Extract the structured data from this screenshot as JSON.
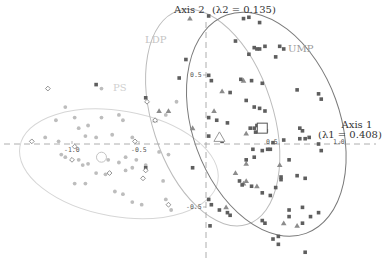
{
  "chart_data": {
    "type": "scatter",
    "title": "",
    "xlabel": "Axis 1",
    "xlabel_sub": "(λ1 = 0.408)",
    "ylabel": "Axis 2",
    "ylabel_sub": "(λ2 = 0.135)",
    "xticks": [
      "-1.0",
      "-0.5",
      "0.5",
      "1.0"
    ],
    "yticks": [
      "0.5",
      "-0.5"
    ],
    "xlim": [
      -1.45,
      1.3
    ],
    "ylim": [
      -0.95,
      1.05
    ],
    "grid": false,
    "groups": [
      {
        "name": "PS",
        "marker": "circle",
        "color": "#bdbdbd",
        "ellipse_color": "#d6d6d6",
        "centroid": [
          -0.78,
          -0.1
        ]
      },
      {
        "name": "LDP",
        "marker": "triangle",
        "color": "#8c8c8c",
        "ellipse_color": "#bcbcbc",
        "centroid": [
          0.1,
          0.05
        ]
      },
      {
        "name": "UMP",
        "marker": "square",
        "color": "#5e5e5e",
        "ellipse_color": "#7a7a7a",
        "centroid": [
          0.42,
          0.12
        ]
      }
    ],
    "other_marker": {
      "name": "other",
      "marker": "open-diamond",
      "color": "#777777"
    },
    "series": [
      {
        "name": "PS",
        "points": [
          [
            -1.05,
            0.28
          ],
          [
            -1.12,
            0.18
          ],
          [
            -0.98,
            0.2
          ],
          [
            -0.95,
            0.12
          ],
          [
            -0.88,
            0.14
          ],
          [
            -0.78,
            0.2
          ],
          [
            -0.65,
            0.22
          ],
          [
            -0.62,
            0.18
          ],
          [
            -0.55,
            0.05
          ],
          [
            -1.2,
            0.05
          ],
          [
            -1.1,
            0.02
          ],
          [
            -0.9,
            0.06
          ],
          [
            -0.82,
            0.05
          ],
          [
            -0.7,
            0.07
          ],
          [
            -1.08,
            -0.08
          ],
          [
            -1.05,
            -0.1
          ],
          [
            -0.95,
            -0.12
          ],
          [
            -0.92,
            -0.16
          ],
          [
            -0.88,
            -0.15
          ],
          [
            -0.8,
            -0.1
          ],
          [
            -0.73,
            -0.12
          ],
          [
            -0.65,
            -0.14
          ],
          [
            -0.6,
            -0.1
          ],
          [
            -0.52,
            -0.12
          ],
          [
            -0.45,
            -0.16
          ],
          [
            -0.35,
            -0.06
          ],
          [
            -0.28,
            -0.08
          ],
          [
            -0.55,
            -0.18
          ],
          [
            -0.6,
            -0.2
          ],
          [
            -0.75,
            -0.23
          ],
          [
            -0.82,
            -0.22
          ],
          [
            -0.9,
            -0.3
          ],
          [
            -0.98,
            -0.3
          ],
          [
            -0.68,
            -0.36
          ],
          [
            -0.62,
            -0.38
          ],
          [
            -0.55,
            -0.44
          ],
          [
            -0.48,
            -0.46
          ],
          [
            -0.32,
            -0.28
          ],
          [
            -0.3,
            -0.42
          ],
          [
            -0.26,
            -0.5
          ],
          [
            -0.22,
            0.32
          ],
          [
            -0.78,
            0.42
          ],
          [
            -0.3,
            0.22
          ]
        ]
      },
      {
        "name": "LDP",
        "points": [
          [
            -0.12,
            0.95
          ],
          [
            -0.35,
            0.25
          ],
          [
            -0.28,
            0.25
          ],
          [
            -0.38,
            0.18
          ],
          [
            0.12,
            0.4
          ],
          [
            0.06,
            0.25
          ],
          [
            0.28,
            0.48
          ],
          [
            0.3,
            0.08
          ],
          [
            -0.1,
            0.12
          ],
          [
            0.3,
            -0.15
          ],
          [
            0.22,
            -0.22
          ],
          [
            0.28,
            -0.3
          ],
          [
            0.38,
            -0.32
          ],
          [
            0.55,
            -0.16
          ],
          [
            0.15,
            -0.48
          ],
          [
            0.58,
            -0.6
          ],
          [
            0.68,
            -0.62
          ],
          [
            0.3,
            -0.28
          ]
        ]
      },
      {
        "name": "UMP",
        "points": [
          [
            0.02,
            0.97
          ],
          [
            0.28,
            0.95
          ],
          [
            0.32,
            0.96
          ],
          [
            0.4,
            0.92
          ],
          [
            0.22,
            0.78
          ],
          [
            0.36,
            0.73
          ],
          [
            0.38,
            0.72
          ],
          [
            0.4,
            0.72
          ],
          [
            0.44,
            0.74
          ],
          [
            0.55,
            0.74
          ],
          [
            0.58,
            0.72
          ],
          [
            0.32,
            0.68
          ],
          [
            0.52,
            0.66
          ],
          [
            0.02,
            0.52
          ],
          [
            0.04,
            0.48
          ],
          [
            0.26,
            0.49
          ],
          [
            0.34,
            0.48
          ],
          [
            0.42,
            0.46
          ],
          [
            0.68,
            0.41
          ],
          [
            0.84,
            0.38
          ],
          [
            0.86,
            0.34
          ],
          [
            0.18,
            0.39
          ],
          [
            0.3,
            0.33
          ],
          [
            0.36,
            0.28
          ],
          [
            0.4,
            0.27
          ],
          [
            0.44,
            0.25
          ],
          [
            0.02,
            0.2
          ],
          [
            0.08,
            0.18
          ],
          [
            0.16,
            0.16
          ],
          [
            0.33,
            0.12
          ],
          [
            0.36,
            0.12
          ],
          [
            0.38,
            0.14
          ],
          [
            0.37,
            0.09
          ],
          [
            0.45,
            0.1
          ],
          [
            0.7,
            0.12
          ],
          [
            0.72,
            0.1
          ],
          [
            0.02,
            0.06
          ],
          [
            0.12,
            0.02
          ],
          [
            0.5,
            0.01
          ],
          [
            0.58,
            0.03
          ],
          [
            0.7,
            0.04
          ],
          [
            0.74,
            0.04
          ],
          [
            0.77,
            0.05
          ],
          [
            0.84,
            0.0
          ],
          [
            0.86,
            -0.05
          ],
          [
            0.35,
            -0.04
          ],
          [
            0.42,
            -0.05
          ],
          [
            0.46,
            -0.04
          ],
          [
            0.48,
            -0.04
          ],
          [
            0.3,
            -0.12
          ],
          [
            0.36,
            -0.1
          ],
          [
            0.62,
            -0.12
          ],
          [
            0.56,
            -0.25
          ],
          [
            0.56,
            -0.27
          ],
          [
            0.68,
            -0.24
          ],
          [
            0.74,
            -0.26
          ],
          [
            0.25,
            -0.28
          ],
          [
            0.27,
            -0.31
          ],
          [
            0.34,
            -0.32
          ],
          [
            0.52,
            -0.33
          ],
          [
            0.42,
            -0.37
          ],
          [
            0.48,
            -0.39
          ],
          [
            0.72,
            -0.48
          ],
          [
            0.02,
            -0.42
          ],
          [
            0.04,
            -0.46
          ],
          [
            0.1,
            -0.5
          ],
          [
            0.16,
            -0.52
          ],
          [
            0.18,
            -0.54
          ],
          [
            0.42,
            -0.58
          ],
          [
            0.44,
            -0.6
          ],
          [
            0.62,
            -0.5
          ],
          [
            0.62,
            -0.55
          ],
          [
            0.72,
            -0.6
          ],
          [
            0.78,
            -0.55
          ],
          [
            0.5,
            -0.72
          ],
          [
            0.54,
            -0.76
          ],
          [
            0.54,
            -0.7
          ],
          [
            0.84,
            -0.52
          ],
          [
            0.74,
            -0.82
          ],
          [
            -0.82,
            0.45
          ],
          [
            -0.45,
            0.35
          ],
          [
            -0.2,
            0.5
          ],
          [
            -0.15,
            0.64
          ],
          [
            -0.45,
            -0.18
          ],
          [
            -0.1,
            -0.18
          ],
          [
            0.03,
            -0.62
          ]
        ]
      },
      {
        "name": "other",
        "points": [
          [
            -1.18,
            0.42
          ],
          [
            -0.44,
            0.32
          ],
          [
            -0.38,
            0.18
          ],
          [
            -1.3,
            0.02
          ],
          [
            -0.98,
            -0.02
          ],
          [
            -0.53,
            0.02
          ],
          [
            -1.0,
            -0.12
          ],
          [
            -0.72,
            -0.22
          ],
          [
            -0.45,
            -0.2
          ],
          [
            -0.47,
            -0.26
          ],
          [
            -0.28,
            -0.46
          ]
        ]
      }
    ],
    "centroids": [
      {
        "group": "PS",
        "marker": "open-circle",
        "x": -0.78,
        "y": -0.1
      },
      {
        "group": "LDP",
        "marker": "open-triangle",
        "x": 0.1,
        "y": 0.05
      },
      {
        "group": "UMP",
        "marker": "open-square",
        "x": 0.42,
        "y": 0.12
      }
    ],
    "ellipses": [
      {
        "group": "PS",
        "cx": -0.65,
        "cy": -0.15,
        "rx": 0.75,
        "ry": 0.4,
        "rotation_deg": 10
      },
      {
        "group": "LDP",
        "cx": 0.05,
        "cy": 0.2,
        "rx": 0.45,
        "ry": 0.85,
        "rotation_deg": -18
      },
      {
        "group": "UMP",
        "cx": 0.45,
        "cy": 0.15,
        "rx": 0.55,
        "ry": 0.88,
        "rotation_deg": -20
      }
    ]
  },
  "labels": {
    "axis1": "Axis 1",
    "axis1_eig": "(λ1 = 0.408)",
    "axis2": "Axis 2",
    "axis2_eig": "(λ2 = 0.135)",
    "ps": "PS",
    "ldp": "LDP",
    "ump": "UMP",
    "tick_x_m10": "-1.0",
    "tick_x_m05": "-0.5",
    "tick_x_05": "0.5",
    "tick_x_10": "1.0",
    "tick_y_05": "0.5",
    "tick_y_m05": "-0.5"
  }
}
